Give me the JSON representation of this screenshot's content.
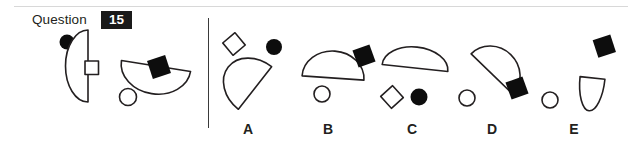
{
  "header": {
    "question_word": "Question",
    "question_number": "15",
    "badge_bg": "#1a1a1a",
    "badge_fg": "#ffffff",
    "rule_color": "#d8d8d8"
  },
  "divider": {
    "name": "vertical-divider",
    "color": "#3a3a3a"
  },
  "colors": {
    "ink": "#231f20",
    "fill_black": "#0d0d0d",
    "fill_white": "#ffffff",
    "page_bg": "#ffffff"
  },
  "prompt": {
    "label": "prompt-figures",
    "figures": [
      {
        "id": "prompt-figure-1",
        "shapes": [
          {
            "name": "black-circle",
            "type": "circle",
            "fill": "black"
          },
          {
            "name": "half-disc",
            "type": "half-disc",
            "fill": "white",
            "flat_edge": "right"
          },
          {
            "name": "white-square",
            "type": "square",
            "fill": "white"
          }
        ]
      },
      {
        "id": "prompt-figure-2",
        "shapes": [
          {
            "name": "black-diamond",
            "type": "diamond",
            "fill": "black"
          },
          {
            "name": "half-disc",
            "type": "half-disc",
            "fill": "white",
            "flat_edge": "top"
          },
          {
            "name": "white-circle",
            "type": "circle",
            "fill": "white"
          }
        ]
      }
    ]
  },
  "options": [
    {
      "letter": "A",
      "id": "option-a",
      "shapes": [
        {
          "name": "white-diamond",
          "type": "diamond",
          "fill": "white"
        },
        {
          "name": "black-circle",
          "type": "circle",
          "fill": "black"
        },
        {
          "name": "half-disc",
          "type": "half-disc",
          "fill": "white",
          "rotation": 130
        }
      ]
    },
    {
      "letter": "B",
      "id": "option-b",
      "shapes": [
        {
          "name": "half-disc",
          "type": "half-disc",
          "fill": "white",
          "rotation": 0
        },
        {
          "name": "black-diamond",
          "type": "diamond",
          "fill": "black"
        },
        {
          "name": "white-circle",
          "type": "circle",
          "fill": "white"
        }
      ]
    },
    {
      "letter": "C",
      "id": "option-c",
      "shapes": [
        {
          "name": "half-disc",
          "type": "half-disc",
          "fill": "white",
          "rotation": 6,
          "flattened": true
        },
        {
          "name": "white-diamond",
          "type": "diamond",
          "fill": "white"
        },
        {
          "name": "black-circle",
          "type": "circle",
          "fill": "black"
        }
      ]
    },
    {
      "letter": "D",
      "id": "option-d",
      "shapes": [
        {
          "name": "half-disc",
          "type": "half-disc",
          "fill": "white",
          "rotation": 45
        },
        {
          "name": "white-circle",
          "type": "circle",
          "fill": "white"
        },
        {
          "name": "black-diamond",
          "type": "diamond",
          "fill": "black"
        }
      ]
    },
    {
      "letter": "E",
      "id": "option-e",
      "shapes": [
        {
          "name": "black-diamond",
          "type": "diamond",
          "fill": "black"
        },
        {
          "name": "half-disc",
          "type": "half-disc",
          "fill": "white",
          "rotation": 180,
          "narrow": true
        },
        {
          "name": "white-circle",
          "type": "circle",
          "fill": "white"
        }
      ]
    }
  ]
}
